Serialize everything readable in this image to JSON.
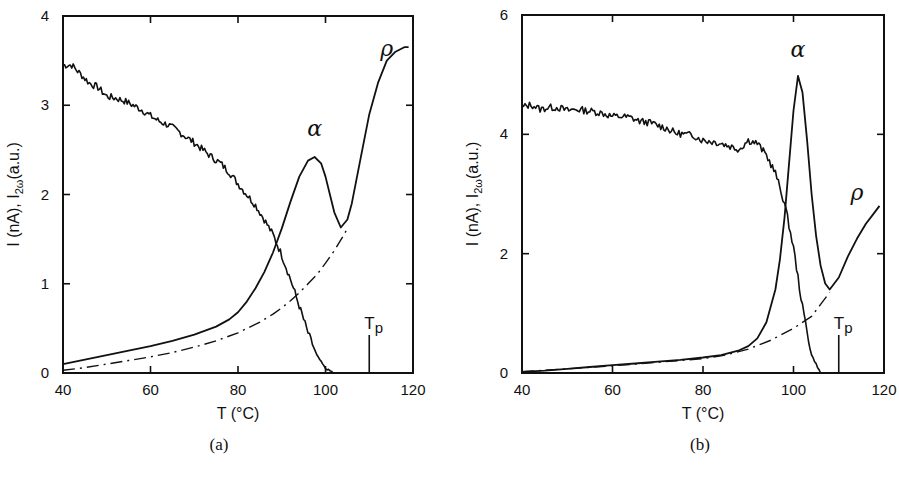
{
  "figure": {
    "panels": [
      {
        "id": "a",
        "caption": "(a)"
      },
      {
        "id": "b",
        "caption": "(b)"
      }
    ]
  },
  "chart_data": [
    {
      "type": "line",
      "panel": "(a)",
      "xlabel": "T (°C)",
      "ylabel": "I (nA), I2ω(a.u.)",
      "xlim": [
        40,
        120
      ],
      "ylim": [
        0,
        4
      ],
      "xticks": [
        40,
        60,
        80,
        100,
        120
      ],
      "yticks": [
        0,
        1,
        2,
        3,
        4
      ],
      "grid": false,
      "legend": null,
      "annotations": [
        {
          "text": "α",
          "x": 97.5,
          "y": 2.65
        },
        {
          "text": "ρ",
          "x": 114,
          "y": 3.55
        },
        {
          "text": "Tp",
          "x": 110,
          "y": 0.5,
          "marker": "vertical line at T=110"
        }
      ],
      "series": [
        {
          "name": "I2ω (SHG intensity, noisy decay)",
          "style": "solid-noisy",
          "x": [
            40,
            42,
            44,
            46,
            48,
            50,
            52,
            54,
            56,
            58,
            60,
            62,
            64,
            66,
            68,
            70,
            72,
            74,
            76,
            78,
            80,
            82,
            84,
            86,
            88,
            90,
            92,
            94,
            96,
            98,
            100,
            102
          ],
          "y": [
            3.45,
            3.45,
            3.35,
            3.25,
            3.2,
            3.1,
            3.08,
            3.05,
            3.0,
            2.95,
            2.88,
            2.82,
            2.78,
            2.72,
            2.65,
            2.58,
            2.5,
            2.42,
            2.35,
            2.25,
            2.12,
            2.0,
            1.88,
            1.72,
            1.55,
            1.32,
            1.05,
            0.75,
            0.45,
            0.2,
            0.05,
            0.0
          ]
        },
        {
          "name": "I (TSC current, α and ρ peaks)",
          "style": "solid",
          "x": [
            40,
            45,
            50,
            55,
            60,
            65,
            70,
            75,
            78,
            80,
            82,
            84,
            86,
            88,
            90,
            92,
            94,
            96,
            97.5,
            99,
            100,
            101,
            102,
            103.5,
            105,
            106,
            108,
            110,
            112,
            114,
            116,
            118,
            119
          ],
          "y": [
            0.1,
            0.15,
            0.2,
            0.25,
            0.3,
            0.36,
            0.43,
            0.52,
            0.6,
            0.68,
            0.8,
            0.95,
            1.13,
            1.35,
            1.62,
            1.92,
            2.2,
            2.38,
            2.42,
            2.35,
            2.2,
            2.0,
            1.8,
            1.63,
            1.72,
            1.9,
            2.4,
            2.9,
            3.25,
            3.5,
            3.6,
            3.65,
            3.65
          ]
        },
        {
          "name": "Baseline (dash-dot)",
          "style": "dash-dot",
          "x": [
            40,
            45,
            50,
            55,
            60,
            65,
            70,
            75,
            80,
            85,
            88,
            90,
            92,
            94,
            96,
            98,
            100,
            102,
            104,
            105
          ],
          "y": [
            0.03,
            0.06,
            0.1,
            0.14,
            0.18,
            0.23,
            0.29,
            0.36,
            0.45,
            0.57,
            0.66,
            0.73,
            0.81,
            0.9,
            1.0,
            1.1,
            1.23,
            1.37,
            1.53,
            1.62
          ]
        }
      ]
    },
    {
      "type": "line",
      "panel": "(b)",
      "xlabel": "T (°C)",
      "ylabel": "I (nA), I2ω(a.u.)",
      "xlim": [
        40,
        120
      ],
      "ylim": [
        0,
        6
      ],
      "xticks": [
        40,
        60,
        80,
        100,
        120
      ],
      "yticks": [
        0,
        2,
        4,
        6
      ],
      "grid": false,
      "legend": null,
      "annotations": [
        {
          "text": "α",
          "x": 101,
          "y": 5.3
        },
        {
          "text": "ρ",
          "x": 114,
          "y": 2.9
        },
        {
          "text": "Tp",
          "x": 110,
          "y": 0.6,
          "marker": "vertical line at T=110"
        }
      ],
      "series": [
        {
          "name": "I2ω (SHG intensity, noisy plateau then drop)",
          "style": "solid-noisy",
          "x": [
            40,
            42,
            44,
            46,
            48,
            50,
            52,
            54,
            56,
            58,
            60,
            62,
            64,
            66,
            68,
            70,
            72,
            74,
            76,
            78,
            80,
            82,
            84,
            86,
            88,
            90,
            92,
            94,
            96,
            98,
            100,
            102,
            104,
            106
          ],
          "y": [
            4.45,
            4.5,
            4.42,
            4.45,
            4.45,
            4.4,
            4.42,
            4.4,
            4.38,
            4.35,
            4.3,
            4.3,
            4.28,
            4.22,
            4.2,
            4.15,
            4.1,
            4.02,
            4.0,
            3.98,
            3.9,
            3.88,
            3.85,
            3.8,
            3.75,
            3.9,
            3.85,
            3.65,
            3.35,
            2.85,
            2.1,
            1.1,
            0.3,
            0.0
          ]
        },
        {
          "name": "I (TSC current, α and ρ peaks)",
          "style": "solid",
          "x": [
            40,
            45,
            50,
            55,
            60,
            65,
            70,
            75,
            80,
            84,
            88,
            90,
            92,
            94,
            96,
            97,
            98,
            99,
            100,
            101,
            102,
            103,
            104,
            105,
            106,
            107,
            108,
            110,
            112,
            114,
            116,
            118,
            119
          ],
          "y": [
            0.02,
            0.04,
            0.07,
            0.1,
            0.13,
            0.16,
            0.19,
            0.22,
            0.26,
            0.3,
            0.38,
            0.45,
            0.58,
            0.85,
            1.4,
            1.9,
            2.6,
            3.5,
            4.4,
            4.98,
            4.7,
            3.9,
            3.0,
            2.3,
            1.8,
            1.5,
            1.4,
            1.6,
            1.95,
            2.25,
            2.5,
            2.7,
            2.8
          ]
        },
        {
          "name": "Baseline (dash-dot)",
          "style": "dash-dot",
          "x": [
            40,
            50,
            60,
            70,
            80,
            85,
            90,
            95,
            100,
            104,
            106,
            108
          ],
          "y": [
            0.02,
            0.07,
            0.12,
            0.18,
            0.24,
            0.3,
            0.4,
            0.55,
            0.75,
            0.95,
            1.15,
            1.35
          ]
        }
      ]
    }
  ]
}
